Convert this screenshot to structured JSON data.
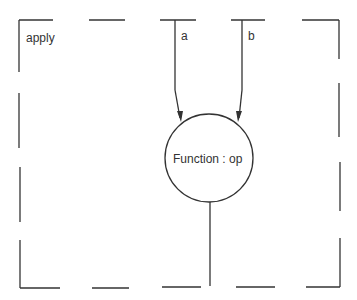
{
  "diagram": {
    "frame_label": "apply",
    "function_label": "Function : op",
    "inputs": [
      {
        "label": "a"
      },
      {
        "label": "b"
      }
    ],
    "stroke_color": "#333333",
    "background": "#ffffff"
  }
}
